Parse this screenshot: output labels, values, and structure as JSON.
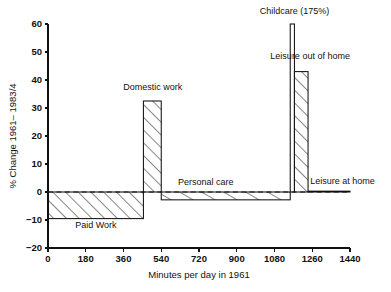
{
  "figure": {
    "ghost_caption": "",
    "background_color": "#ffffff",
    "ink_color": "#111111"
  },
  "chart_data": {
    "type": "bar",
    "title": "",
    "subtitle": "",
    "xlabel": "Minutes per day in 1961",
    "ylabel": "% Change 1961– 1983/4",
    "xlim": [
      0,
      1440
    ],
    "ylim": [
      -20,
      60
    ],
    "grid": false,
    "legend_position": "none",
    "zero_reference_line": true,
    "x_ticks": [
      0,
      180,
      360,
      540,
      720,
      900,
      1080,
      1260,
      1440
    ],
    "x_tick_labels": [
      "0",
      "180",
      "360",
      "540",
      "720",
      "900",
      "1080",
      "1260",
      "1440"
    ],
    "y_ticks": [
      -20,
      -10,
      0,
      10,
      20,
      30,
      40,
      50,
      60
    ],
    "y_tick_labels": [
      "−20",
      "−10",
      "0",
      "10",
      "20",
      "30",
      "40",
      "50",
      "60"
    ],
    "note": "Marimekko-style variable-width bars: width = minutes per day in 1961, height = % change 1961-1983/4",
    "bars": [
      {
        "name": "Paid Work",
        "label": "Paid Work",
        "x_start": 0,
        "x_end": 455,
        "value": -9.5,
        "hatched": true,
        "label_x": 228,
        "label_y": -13.0,
        "label_anchor": "middle"
      },
      {
        "name": "Domestic work",
        "label": "Domestic work",
        "x_start": 455,
        "x_end": 540,
        "value": 32.5,
        "hatched": true,
        "label_x": 500,
        "label_y": 36.5,
        "label_anchor": "middle"
      },
      {
        "name": "Personal care",
        "label": "Personal care",
        "x_start": 540,
        "x_end": 1155,
        "value": -2.8,
        "hatched": true,
        "label_x": 620,
        "label_y": 2.6,
        "label_anchor": "start"
      },
      {
        "name": "Childcare",
        "label": "Childcare (175%)",
        "x_start": 1155,
        "x_end": 1175,
        "value": 60,
        "clipped": true,
        "actual_value": 175,
        "hatched": false,
        "label_x": 1175,
        "label_y": 63.5,
        "label_anchor": "middle"
      },
      {
        "name": "Leisure out of home",
        "label": "Leisure out of home",
        "x_start": 1175,
        "x_end": 1240,
        "value": 43,
        "hatched": true,
        "label_x": 1250,
        "label_y": 47.5,
        "label_anchor": "middle"
      },
      {
        "name": "Leisure at home",
        "label": "Leisure at home",
        "x_start": 1240,
        "x_end": 1440,
        "value": 0.3,
        "hatched": false,
        "label_x": 1250,
        "label_y": 3.0,
        "label_anchor": "start"
      }
    ]
  }
}
